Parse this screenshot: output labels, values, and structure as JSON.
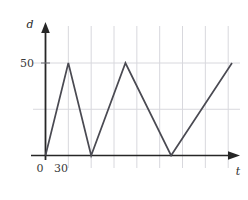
{
  "figure": {
    "background_color": "#ffffff",
    "grid_color": "#d8d8dd",
    "axis_color": "#262626",
    "series_color": "#4a4a52"
  },
  "axes": {
    "y_axis_label": "d",
    "x_axis_label": "t",
    "origin_label": "0",
    "y_ticks": [
      {
        "label": "50",
        "value": 50
      }
    ],
    "x_ticks": [
      {
        "label": "30",
        "value": 30
      }
    ],
    "y_axis_arrow": "up-arrow-icon",
    "x_axis_arrow": "right-arrow-icon"
  },
  "chart_data": {
    "type": "line",
    "title": "",
    "subtitle": "",
    "xlabel": "t",
    "ylabel": "d",
    "xlim": [
      0,
      270
    ],
    "ylim": [
      0,
      100
    ],
    "grid": true,
    "legend": null,
    "legend_position": "none",
    "x_tick_labels": [
      "0",
      "30"
    ],
    "y_tick_labels": [
      "50"
    ],
    "annotations": [],
    "series": [
      {
        "name": "d(t)",
        "color": "#4a4a52",
        "points": [
          {
            "x": 0,
            "y": 0
          },
          {
            "x": 30,
            "y": 50
          },
          {
            "x": 60,
            "y": 0
          },
          {
            "x": 105,
            "y": 50
          },
          {
            "x": 165,
            "y": 0
          },
          {
            "x": 245,
            "y": 50
          }
        ]
      }
    ],
    "gridlines": {
      "vertical_values": [
        30,
        60,
        90,
        120,
        150,
        180,
        210,
        240
      ],
      "horizontal_values": [
        25,
        50,
        75,
        100,
        125
      ]
    }
  }
}
